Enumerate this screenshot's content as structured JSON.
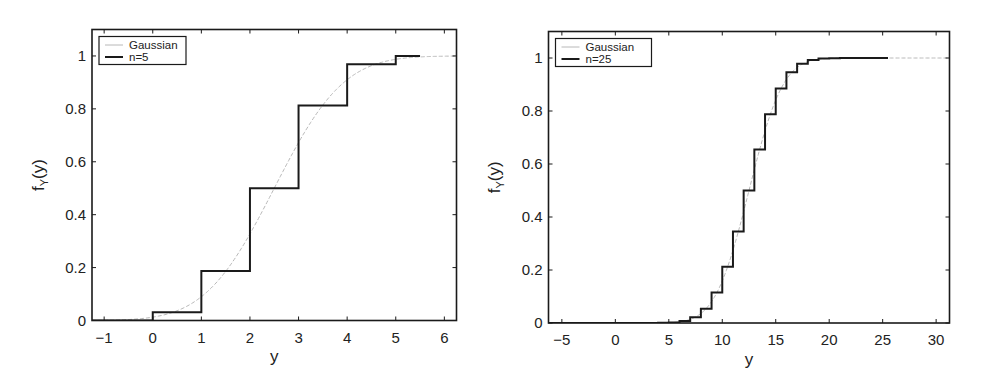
{
  "chart_data": [
    {
      "type": "line",
      "title": "",
      "xlabel": "y",
      "ylabel": "f",
      "ylabel_subscript": "Y",
      "ylabel_suffix": "(y)",
      "xlim": [
        -1.25,
        6.25
      ],
      "ylim": [
        0,
        1.1
      ],
      "xticks": [
        -1,
        0,
        1,
        2,
        3,
        4,
        5,
        6
      ],
      "xtick_labels": [
        "−1",
        "0",
        "1",
        "2",
        "3",
        "4",
        "5",
        "6"
      ],
      "yticks": [
        0,
        0.2,
        0.4,
        0.6,
        0.8,
        1
      ],
      "ytick_labels": [
        "0",
        "0.2",
        "0.4",
        "0.6",
        "0.8",
        "1"
      ],
      "grid": false,
      "legend": {
        "position": "top-left",
        "entries": [
          "Gaussian",
          "n=5"
        ]
      },
      "series": [
        {
          "name": "Gaussian",
          "kind": "normal-cdf",
          "mean": 2.5,
          "std": 1.118,
          "color": "#b8b8b8",
          "style": "dashed-thin"
        },
        {
          "name": "n=5",
          "kind": "step",
          "color": "#1a1a1a",
          "style": "solid",
          "x": [
            0,
            1,
            2,
            3,
            4,
            5
          ],
          "values": [
            0.03125,
            0.1875,
            0.5,
            0.8125,
            0.96875,
            1.0
          ],
          "start_value": 0,
          "end_x": 5.5
        }
      ]
    },
    {
      "type": "line",
      "title": "",
      "xlabel": "y",
      "ylabel": "f",
      "ylabel_subscript": "Y",
      "ylabel_suffix": "(y)",
      "xlim": [
        -6.25,
        31.25
      ],
      "ylim": [
        0,
        1.1
      ],
      "xticks": [
        -5,
        0,
        5,
        10,
        15,
        20,
        25,
        30
      ],
      "xtick_labels": [
        "−5",
        "0",
        "5",
        "10",
        "15",
        "20",
        "25",
        "30"
      ],
      "yticks": [
        0,
        0.2,
        0.4,
        0.6,
        0.8,
        1
      ],
      "ytick_labels": [
        "0",
        "0.2",
        "0.4",
        "0.6",
        "0.8",
        "1"
      ],
      "grid": false,
      "legend": {
        "position": "top-left",
        "entries": [
          "Gaussian",
          "n=25"
        ]
      },
      "series": [
        {
          "name": "Gaussian",
          "kind": "normal-cdf",
          "mean": 12.5,
          "std": 2.5,
          "color": "#b8b8b8",
          "style": "dashed-thin"
        },
        {
          "name": "n=25",
          "kind": "step",
          "color": "#1a1a1a",
          "style": "solid",
          "x": [
            0,
            1,
            2,
            3,
            4,
            5,
            6,
            7,
            8,
            9,
            10,
            11,
            12,
            13,
            14,
            15,
            16,
            17,
            18,
            19,
            20,
            21,
            22,
            23,
            24,
            25
          ],
          "values": [
            0.0,
            0.0,
            0.0,
            0.0001,
            0.0005,
            0.002,
            0.0073,
            0.0216,
            0.0539,
            0.1148,
            0.2122,
            0.345,
            0.5,
            0.655,
            0.7878,
            0.8852,
            0.9461,
            0.9784,
            0.9927,
            0.998,
            0.9995,
            0.9999,
            1.0,
            1.0,
            1.0,
            1.0
          ],
          "start_value": 0,
          "end_x": 25.5
        }
      ]
    }
  ]
}
